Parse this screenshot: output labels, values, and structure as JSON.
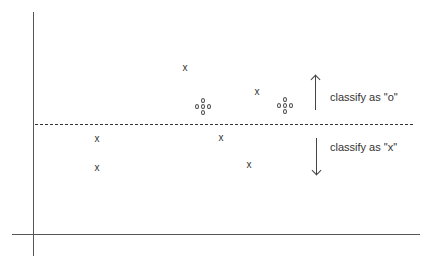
{
  "diagram": {
    "title": "",
    "boundary": {
      "style": "dashed",
      "y": 124
    },
    "regions": [
      {
        "label": "classify as \"o\"",
        "direction": "up"
      },
      {
        "label": "classify as \"x\"",
        "direction": "down"
      }
    ],
    "x_points": [
      {
        "symbol": "x",
        "x": 185,
        "y": 68
      },
      {
        "symbol": "x",
        "x": 257,
        "y": 92
      },
      {
        "symbol": "x",
        "x": 97,
        "y": 139
      },
      {
        "symbol": "x",
        "x": 221,
        "y": 138
      },
      {
        "symbol": "x",
        "x": 97,
        "y": 168
      },
      {
        "symbol": "x",
        "x": 249,
        "y": 165
      }
    ],
    "o_clusters": [
      {
        "symbol": "o",
        "count": 5,
        "x": 203,
        "y": 107
      },
      {
        "symbol": "o",
        "count": 5,
        "x": 285,
        "y": 106
      }
    ]
  }
}
